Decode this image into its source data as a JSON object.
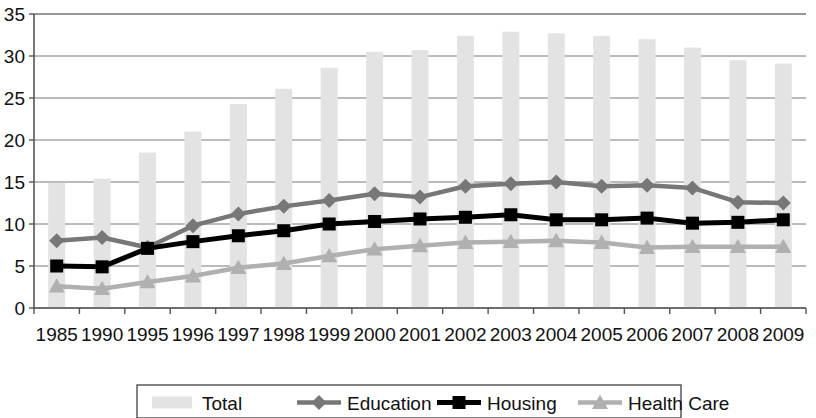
{
  "chart_data": {
    "type": "bar",
    "title": "",
    "subtitle": "",
    "xlabel": "",
    "ylabel": "",
    "ylim": [
      0,
      35
    ],
    "ytick_step": 5,
    "yticks": [
      "0",
      "5",
      "10",
      "15",
      "20",
      "25",
      "30",
      "35"
    ],
    "grid": true,
    "legend_position": "bottom",
    "categories": [
      "1985",
      "1990",
      "1995",
      "1996",
      "1997",
      "1998",
      "1999",
      "2000",
      "2001",
      "2002",
      "2003",
      "2004",
      "2005",
      "2006",
      "2007",
      "2008",
      "2009"
    ],
    "series": [
      {
        "name": "Total",
        "type": "bar",
        "color": "#e3e3e3",
        "marker": "none",
        "values": [
          14.9,
          15.4,
          18.5,
          21.0,
          24.3,
          26.1,
          28.6,
          30.5,
          30.7,
          32.4,
          32.9,
          32.7,
          32.4,
          32.0,
          31.0,
          29.5,
          29.1
        ]
      },
      {
        "name": "Education",
        "type": "line",
        "color": "#777777",
        "marker": "diamond",
        "values": [
          8.0,
          8.4,
          7.2,
          9.8,
          11.2,
          12.1,
          12.8,
          13.6,
          13.2,
          14.5,
          14.8,
          15.0,
          14.5,
          14.6,
          14.3,
          12.6,
          12.5
        ]
      },
      {
        "name": "Housing",
        "type": "line",
        "color": "#000000",
        "marker": "square",
        "values": [
          5.0,
          4.9,
          7.1,
          7.9,
          8.6,
          9.2,
          10.0,
          10.3,
          10.6,
          10.8,
          11.1,
          10.5,
          10.5,
          10.7,
          10.1,
          10.2,
          10.5
        ]
      },
      {
        "name": "Health Care",
        "type": "line",
        "color": "#b0b0b0",
        "marker": "triangle",
        "values": [
          2.6,
          2.3,
          3.1,
          3.8,
          4.8,
          5.3,
          6.2,
          7.0,
          7.4,
          7.8,
          7.9,
          8.0,
          7.8,
          7.2,
          7.3,
          7.3,
          7.3
        ]
      }
    ]
  },
  "legend": {
    "items": [
      {
        "label": "Total",
        "marker": "bar-swatch"
      },
      {
        "label": "Education",
        "marker": "diamond-line"
      },
      {
        "label": "Housing",
        "marker": "square-line"
      },
      {
        "label": "Health Care",
        "marker": "triangle-line"
      }
    ]
  },
  "colors": {
    "bar": "#e3e3e3",
    "education": "#777777",
    "housing": "#000000",
    "health_care": "#b0b0b0",
    "axis": "#555555",
    "grid": "#777777",
    "text": "#111111"
  }
}
